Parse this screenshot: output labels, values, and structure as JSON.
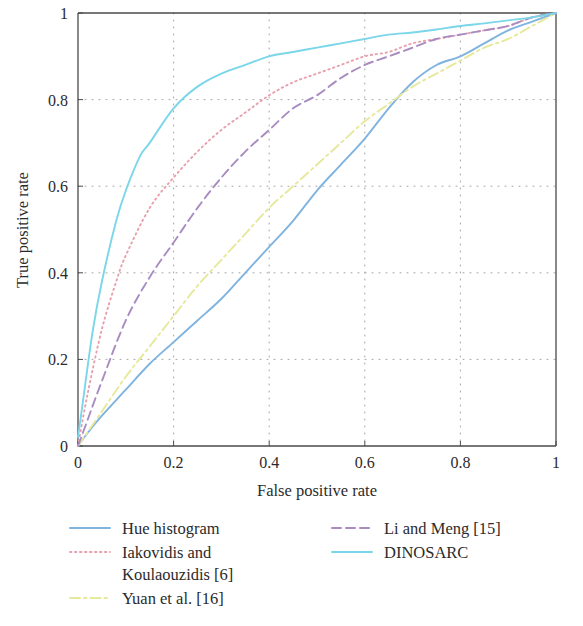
{
  "chart_data": {
    "type": "line",
    "title": "",
    "xlabel": "False positive rate",
    "ylabel": "True positive rate",
    "xlim": [
      0,
      1
    ],
    "ylim": [
      0,
      1
    ],
    "xticks": [
      "0",
      "0.2",
      "0.4",
      "0.6",
      "0.8",
      "1"
    ],
    "xtick_values": [
      0,
      0.2,
      0.4,
      0.6,
      0.8,
      1
    ],
    "yticks": [
      "0",
      "0.2",
      "0.4",
      "0.6",
      "0.8",
      "1"
    ],
    "ytick_values": [
      0,
      0.2,
      0.4,
      0.6,
      0.8,
      1
    ],
    "grid": true,
    "grid_style": "dotted",
    "grid_color": "#9a9a9a",
    "legend_position": "below",
    "series": [
      {
        "name": "Hue histogram",
        "color": "#7fb3e0",
        "dash": "solid",
        "x": [
          0.0,
          0.02,
          0.05,
          0.1,
          0.15,
          0.2,
          0.25,
          0.3,
          0.35,
          0.4,
          0.45,
          0.5,
          0.55,
          0.6,
          0.65,
          0.7,
          0.75,
          0.8,
          0.85,
          0.9,
          0.95,
          1.0
        ],
        "y": [
          0.0,
          0.03,
          0.07,
          0.13,
          0.19,
          0.24,
          0.29,
          0.34,
          0.4,
          0.46,
          0.52,
          0.59,
          0.65,
          0.71,
          0.78,
          0.84,
          0.88,
          0.9,
          0.93,
          0.96,
          0.98,
          1.0
        ]
      },
      {
        "name": "Iakovidis and\nKoulaouzidis [6]",
        "color": "#e8a0ae",
        "dash": "dotted",
        "x": [
          0.0,
          0.02,
          0.05,
          0.08,
          0.1,
          0.15,
          0.2,
          0.25,
          0.3,
          0.35,
          0.4,
          0.45,
          0.5,
          0.55,
          0.6,
          0.65,
          0.7,
          0.75,
          0.8,
          0.85,
          0.9,
          0.95,
          1.0
        ],
        "y": [
          0.0,
          0.12,
          0.27,
          0.38,
          0.44,
          0.55,
          0.62,
          0.68,
          0.73,
          0.77,
          0.81,
          0.84,
          0.86,
          0.88,
          0.9,
          0.91,
          0.93,
          0.94,
          0.95,
          0.96,
          0.97,
          0.99,
          1.0
        ]
      },
      {
        "name": "Yuan et al. [16]",
        "color": "#e6e89a",
        "dash": "dashdot",
        "x": [
          0.0,
          0.05,
          0.1,
          0.15,
          0.2,
          0.25,
          0.3,
          0.35,
          0.4,
          0.45,
          0.5,
          0.55,
          0.6,
          0.65,
          0.7,
          0.75,
          0.8,
          0.85,
          0.9,
          0.95,
          1.0
        ],
        "y": [
          0.0,
          0.08,
          0.16,
          0.23,
          0.3,
          0.37,
          0.43,
          0.49,
          0.55,
          0.6,
          0.65,
          0.7,
          0.75,
          0.79,
          0.83,
          0.86,
          0.89,
          0.92,
          0.94,
          0.97,
          1.0
        ]
      },
      {
        "name": "Li and Meng [15]",
        "color": "#a88cc0",
        "dash": "dashed",
        "x": [
          0.0,
          0.02,
          0.05,
          0.1,
          0.15,
          0.2,
          0.25,
          0.3,
          0.35,
          0.4,
          0.45,
          0.5,
          0.55,
          0.6,
          0.65,
          0.7,
          0.75,
          0.8,
          0.85,
          0.9,
          0.95,
          1.0
        ],
        "y": [
          0.0,
          0.06,
          0.15,
          0.29,
          0.39,
          0.47,
          0.55,
          0.62,
          0.68,
          0.73,
          0.78,
          0.81,
          0.85,
          0.88,
          0.9,
          0.92,
          0.94,
          0.95,
          0.96,
          0.97,
          0.99,
          1.0
        ]
      },
      {
        "name": "DINOSARC",
        "color": "#7ad6e8",
        "dash": "solid",
        "x": [
          0.0,
          0.01,
          0.03,
          0.05,
          0.08,
          0.1,
          0.13,
          0.15,
          0.2,
          0.25,
          0.3,
          0.35,
          0.4,
          0.45,
          0.5,
          0.55,
          0.6,
          0.65,
          0.7,
          0.75,
          0.8,
          0.85,
          0.9,
          0.95,
          1.0
        ],
        "y": [
          0.02,
          0.1,
          0.26,
          0.38,
          0.52,
          0.59,
          0.67,
          0.7,
          0.78,
          0.83,
          0.86,
          0.88,
          0.9,
          0.91,
          0.92,
          0.93,
          0.94,
          0.95,
          0.955,
          0.962,
          0.97,
          0.976,
          0.983,
          0.99,
          1.0
        ]
      }
    ]
  },
  "axes": {
    "xlabel": "False positive rate",
    "ylabel": "True positive rate",
    "xtick_labels": [
      "0",
      "0.2",
      "0.4",
      "0.6",
      "0.8",
      "1"
    ],
    "ytick_labels": [
      "0",
      "0.2",
      "0.4",
      "0.6",
      "0.8",
      "1"
    ]
  },
  "legend": {
    "left_column": [
      {
        "label": "Hue histogram",
        "color": "#7fb3e0",
        "dash": "solid"
      },
      {
        "label": "Iakovidis and\nKoulaouzidis [6]",
        "color": "#e8a0ae",
        "dash": "dotted"
      },
      {
        "label": "Yuan et al. [16]",
        "color": "#e6e89a",
        "dash": "dashdot"
      }
    ],
    "right_column": [
      {
        "label": "Li and Meng [15]",
        "color": "#a88cc0",
        "dash": "dashed"
      },
      {
        "label": "DINOSARC",
        "color": "#7ad6e8",
        "dash": "solid"
      }
    ]
  }
}
